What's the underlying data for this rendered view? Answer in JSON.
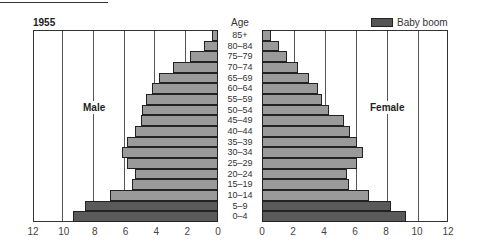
{
  "chart_data": {
    "type": "bar",
    "subtype": "population-pyramid",
    "title": "1955",
    "category_axis_title": "Age",
    "categories": [
      "85+",
      "80–84",
      "75–79",
      "70–74",
      "65–69",
      "60–64",
      "55–59",
      "50–54",
      "45–49",
      "40–44",
      "35–39",
      "30–34",
      "25–29",
      "20–24",
      "15–19",
      "10–14",
      "5–9",
      "0–4"
    ],
    "series": [
      {
        "name": "Male",
        "side": "left",
        "values": [
          0.4,
          0.9,
          1.8,
          2.9,
          3.8,
          4.3,
          4.7,
          4.9,
          5.0,
          5.4,
          5.9,
          6.2,
          5.9,
          5.4,
          5.6,
          7.0,
          8.6,
          9.4
        ]
      },
      {
        "name": "Female",
        "side": "right",
        "values": [
          0.6,
          1.1,
          1.6,
          2.3,
          3.0,
          3.6,
          3.9,
          4.3,
          5.3,
          5.7,
          6.1,
          6.5,
          6.1,
          5.5,
          5.6,
          6.9,
          8.3,
          9.3
        ]
      }
    ],
    "highlight": {
      "label": "Baby boom",
      "categories": [
        "5–9",
        "0–4"
      ],
      "color": "#5a5a5a"
    },
    "colors": {
      "normal": "#9a9a9a",
      "baby_boom": "#5a5a5a"
    },
    "x_ticks_left": [
      "12",
      "10",
      "8",
      "6",
      "4",
      "2",
      "0"
    ],
    "x_ticks_right": [
      "0",
      "2",
      "4",
      "6",
      "8",
      "10",
      "12"
    ],
    "xlim": [
      0,
      12
    ],
    "grid": true,
    "legend_position": "top-right"
  },
  "labels": {
    "year": "1955",
    "age": "Age",
    "male": "Male",
    "female": "Female",
    "legend": "Baby boom"
  }
}
